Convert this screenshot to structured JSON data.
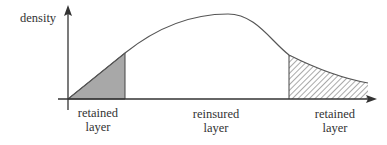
{
  "diagram": {
    "y_axis_label": "density",
    "regions": [
      {
        "id": "left",
        "line1": "retained",
        "line2": "layer",
        "fill": "solid-gray"
      },
      {
        "id": "middle",
        "line1": "reinsured",
        "line2": "layer",
        "fill": "none"
      },
      {
        "id": "right",
        "line1": "retained",
        "line2": "layer",
        "fill": "hatched"
      }
    ],
    "colors": {
      "axis": "#333333",
      "curve": "#555555",
      "solid_fill": "#a8a8a8",
      "hatch": "#555555"
    }
  }
}
